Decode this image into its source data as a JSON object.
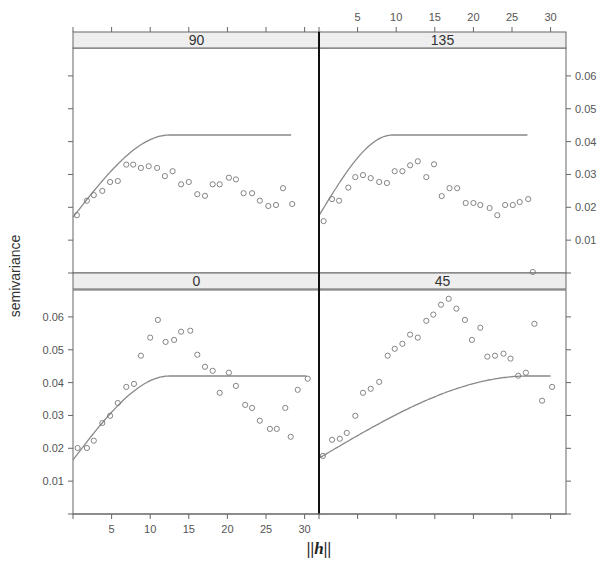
{
  "chart_data": {
    "type": "scatter",
    "title": "",
    "xlabel": "||h||",
    "ylabel": "semivariance",
    "xlim": [
      0,
      31
    ],
    "ylim": [
      0,
      0.068
    ],
    "x_ticks": [
      5,
      10,
      15,
      20,
      25,
      30
    ],
    "y_ticks": [
      0.01,
      0.02,
      0.03,
      0.04,
      0.05,
      0.06
    ],
    "y_tick_labels": [
      "0.01",
      "0.02",
      "0.03",
      "0.04",
      "0.05",
      "0.06"
    ],
    "x_tick_labels": [
      "5",
      "10",
      "15",
      "20",
      "25",
      "30"
    ],
    "grid": false,
    "legend": null,
    "layout": "2x2 lattice panels (directional variograms)",
    "panels": [
      {
        "strip": "90",
        "position": "top-left",
        "model": {
          "type": "spherical",
          "nugget": 0.017,
          "sill": 0.042,
          "range": 12.5,
          "x_max": 28.4
        },
        "points": [
          [
            0.5,
            0.0176
          ],
          [
            1.8,
            0.022
          ],
          [
            2.7,
            0.0237
          ],
          [
            3.8,
            0.025
          ],
          [
            4.8,
            0.0277
          ],
          [
            5.8,
            0.028
          ],
          [
            6.9,
            0.033
          ],
          [
            7.8,
            0.033
          ],
          [
            8.8,
            0.032
          ],
          [
            9.8,
            0.0325
          ],
          [
            10.9,
            0.032
          ],
          [
            11.9,
            0.0295
          ],
          [
            12.9,
            0.031
          ],
          [
            14.0,
            0.027
          ],
          [
            15.0,
            0.0277
          ],
          [
            16.1,
            0.024
          ],
          [
            17.1,
            0.0235
          ],
          [
            18.1,
            0.027
          ],
          [
            19.0,
            0.027
          ],
          [
            20.2,
            0.029
          ],
          [
            21.1,
            0.0285
          ],
          [
            22.1,
            0.0243
          ],
          [
            23.2,
            0.0243
          ],
          [
            24.2,
            0.022
          ],
          [
            25.3,
            0.0204
          ],
          [
            26.3,
            0.0207
          ],
          [
            27.2,
            0.0258
          ],
          [
            28.4,
            0.021
          ]
        ]
      },
      {
        "strip": "135",
        "position": "top-right",
        "model": {
          "type": "spherical",
          "nugget": 0.0175,
          "sill": 0.042,
          "range": 9.5,
          "x_max": 27.1
        },
        "points": [
          [
            0.6,
            0.0158
          ],
          [
            1.7,
            0.0225
          ],
          [
            2.6,
            0.022
          ],
          [
            3.8,
            0.026
          ],
          [
            4.7,
            0.0292
          ],
          [
            5.7,
            0.0298
          ],
          [
            6.7,
            0.0289
          ],
          [
            7.8,
            0.0277
          ],
          [
            8.8,
            0.0274
          ],
          [
            9.8,
            0.031
          ],
          [
            10.8,
            0.031
          ],
          [
            11.8,
            0.0328
          ],
          [
            12.8,
            0.034
          ],
          [
            13.9,
            0.0292
          ],
          [
            14.9,
            0.0331
          ],
          [
            15.9,
            0.0234
          ],
          [
            16.9,
            0.0258
          ],
          [
            17.9,
            0.0258
          ],
          [
            19.0,
            0.0213
          ],
          [
            20.0,
            0.0213
          ],
          [
            20.9,
            0.0207
          ],
          [
            22.1,
            0.0198
          ],
          [
            23.1,
            0.0176
          ],
          [
            24.1,
            0.0207
          ],
          [
            25.1,
            0.0207
          ],
          [
            26.0,
            0.0216
          ],
          [
            27.1,
            0.0225
          ],
          [
            27.7,
            0.0003
          ]
        ]
      },
      {
        "strip": "0",
        "position": "bottom-left",
        "model": {
          "type": "spherical",
          "nugget": 0.0165,
          "sill": 0.042,
          "range": 12.5,
          "x_max": 30.4
        },
        "points": [
          [
            0.6,
            0.0201
          ],
          [
            1.8,
            0.0201
          ],
          [
            2.7,
            0.0223
          ],
          [
            3.8,
            0.0277
          ],
          [
            4.8,
            0.0299
          ],
          [
            5.8,
            0.0338
          ],
          [
            6.9,
            0.0387
          ],
          [
            7.9,
            0.0396
          ],
          [
            8.8,
            0.0482
          ],
          [
            10.0,
            0.0537
          ],
          [
            11.0,
            0.0591
          ],
          [
            12.0,
            0.0524
          ],
          [
            13.1,
            0.053
          ],
          [
            14.0,
            0.0555
          ],
          [
            15.2,
            0.0558
          ],
          [
            16.1,
            0.0485
          ],
          [
            17.1,
            0.0448
          ],
          [
            18.1,
            0.0436
          ],
          [
            19.0,
            0.0369
          ],
          [
            20.2,
            0.043
          ],
          [
            21.1,
            0.039
          ],
          [
            22.3,
            0.0332
          ],
          [
            23.2,
            0.0323
          ],
          [
            24.2,
            0.0284
          ],
          [
            25.5,
            0.0259
          ],
          [
            26.4,
            0.0259
          ],
          [
            27.5,
            0.0323
          ],
          [
            28.2,
            0.0235
          ],
          [
            29.1,
            0.0378
          ],
          [
            30.4,
            0.0412
          ]
        ]
      },
      {
        "strip": "45",
        "position": "bottom-right",
        "model": {
          "type": "spherical",
          "nugget": 0.017,
          "sill": 0.042,
          "range": 27,
          "x_max": 30.2
        },
        "points": [
          [
            0.5,
            0.0177
          ],
          [
            1.7,
            0.0226
          ],
          [
            2.7,
            0.0229
          ],
          [
            3.6,
            0.0247
          ],
          [
            4.7,
            0.0299
          ],
          [
            5.7,
            0.0369
          ],
          [
            6.7,
            0.0381
          ],
          [
            7.8,
            0.0402
          ],
          [
            8.9,
            0.0482
          ],
          [
            9.8,
            0.0503
          ],
          [
            10.8,
            0.0518
          ],
          [
            11.8,
            0.0546
          ],
          [
            12.8,
            0.0537
          ],
          [
            13.9,
            0.0588
          ],
          [
            14.8,
            0.0607
          ],
          [
            15.8,
            0.0637
          ],
          [
            16.8,
            0.0655
          ],
          [
            17.8,
            0.0625
          ],
          [
            18.9,
            0.0591
          ],
          [
            19.8,
            0.053
          ],
          [
            20.9,
            0.0567
          ],
          [
            21.8,
            0.0479
          ],
          [
            22.8,
            0.0482
          ],
          [
            23.9,
            0.0488
          ],
          [
            24.8,
            0.0473
          ],
          [
            25.8,
            0.0421
          ],
          [
            26.8,
            0.043
          ],
          [
            27.9,
            0.0579
          ],
          [
            28.9,
            0.0345
          ],
          [
            30.2,
            0.0387
          ]
        ]
      }
    ]
  },
  "labels": {
    "ylabel": "semivariance",
    "xlabel": "||h||",
    "strip_90": "90",
    "strip_135": "135",
    "strip_0": "0",
    "strip_45": "45"
  },
  "colors": {
    "strip_bg": "#eeeeee",
    "frame": "#666666",
    "divider": "#111111",
    "points": "#777777",
    "model_line": "#888888"
  }
}
